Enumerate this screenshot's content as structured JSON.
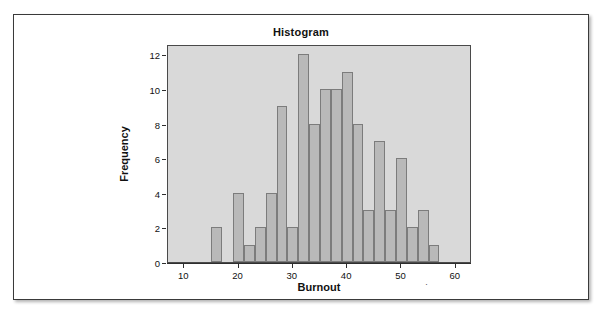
{
  "figure": {
    "title": "Histogram"
  },
  "chart_data": {
    "type": "bar",
    "title": "Histogram",
    "xlabel": "Burnout",
    "ylabel": "Frequency",
    "xlim": [
      7,
      63
    ],
    "ylim": [
      0,
      12.6
    ],
    "grid": false,
    "legend": null,
    "bin_width": 2,
    "bin_starts": [
      15,
      17,
      19,
      21,
      23,
      25,
      27,
      29,
      31,
      33,
      35,
      37,
      39,
      41,
      43,
      45,
      47,
      49,
      51,
      53,
      55
    ],
    "categories": [
      "15-17",
      "17-19",
      "19-21",
      "21-23",
      "23-25",
      "25-27",
      "27-29",
      "29-31",
      "31-33",
      "33-35",
      "35-37",
      "37-39",
      "39-41",
      "41-43",
      "43-45",
      "45-47",
      "47-49",
      "49-51",
      "51-53",
      "53-55",
      "55-57"
    ],
    "values": [
      2,
      0,
      4,
      1,
      2,
      4,
      9,
      2,
      12,
      8,
      10,
      10,
      11,
      8,
      3,
      7,
      3,
      6,
      2,
      3,
      1
    ],
    "x_ticks": [
      10,
      20,
      30,
      40,
      50,
      60
    ],
    "x_tick_labels": [
      "10",
      "20",
      "30",
      "40",
      "50",
      "60"
    ],
    "y_ticks": [
      0,
      2,
      4,
      6,
      8,
      10,
      12
    ],
    "y_tick_labels": [
      "0",
      "2",
      "4",
      "6",
      "8",
      "10",
      "12"
    ],
    "bar_color": "#b9b9b9",
    "bar_edge_color": "#7c7c7c",
    "panel_background": "#d9d9d9"
  },
  "axes": {
    "x_title": "Burnout",
    "x_title_mark": "·",
    "y_title": "Frequency"
  }
}
